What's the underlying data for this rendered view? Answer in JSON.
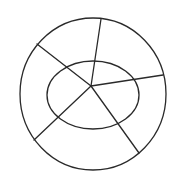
{
  "diagram": {
    "type": "concentric-shapes-with-spokes",
    "canvas": {
      "width": 179,
      "height": 183,
      "background": "#ffffff"
    },
    "stroke_color": "#2a2a2a",
    "stroke_width": 1.3,
    "outer_circle": {
      "cx": 93,
      "cy": 94,
      "rx": 73,
      "ry": 76
    },
    "inner_ellipse": {
      "cx": 93,
      "cy": 95,
      "rx": 46,
      "ry": 34
    },
    "hub": {
      "x": 91,
      "y": 86
    },
    "spokes": [
      {
        "name": "top",
        "x2": 101,
        "y2": 19
      },
      {
        "name": "right",
        "x2": 163,
        "y2": 75
      },
      {
        "name": "bottom-right",
        "x2": 139,
        "y2": 153
      },
      {
        "name": "bottom-left",
        "x2": 34,
        "y2": 140
      },
      {
        "name": "upper-left",
        "x2": 37,
        "y2": 44
      }
    ]
  }
}
